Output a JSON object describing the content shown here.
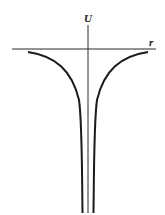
{
  "diagram": {
    "type": "potential-energy-curve",
    "axes": {
      "vertical_label": "U",
      "horizontal_label": "r"
    },
    "colors": {
      "axis": "#2a2a2a",
      "curve": "#1a1a1a",
      "background": "#ffffff"
    }
  }
}
